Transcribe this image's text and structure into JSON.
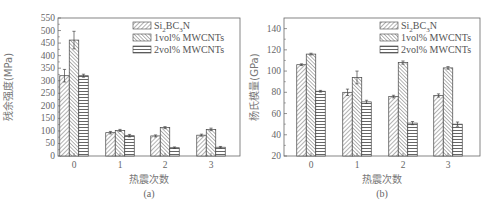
{
  "chart_data": [
    {
      "id": "a",
      "type": "bar",
      "title": "",
      "caption": "(a)",
      "xlabel": "热震次数",
      "ylabel": "残余强度(MPa)",
      "categories": [
        "0",
        "1",
        "2",
        "3"
      ],
      "ylim": [
        0,
        550
      ],
      "yticks": [
        0,
        50,
        100,
        150,
        200,
        250,
        300,
        350,
        400,
        450,
        500,
        550
      ],
      "grid": false,
      "legend_position": "upper right",
      "series": [
        {
          "name": "Si2BC3N",
          "pattern": "diagonal-forward",
          "values": [
            320,
            93,
            80,
            83
          ],
          "errors": [
            25,
            5,
            4,
            4
          ]
        },
        {
          "name": "1vol% MWCNTs",
          "pattern": "diagonal-backward",
          "values": [
            462,
            102,
            113,
            106
          ],
          "errors": [
            35,
            4,
            4,
            5
          ]
        },
        {
          "name": "2vol% MWCNTs",
          "pattern": "horizontal",
          "values": [
            320,
            81,
            33,
            35
          ],
          "errors": [
            6,
            5,
            3,
            3
          ]
        }
      ]
    },
    {
      "id": "b",
      "type": "bar",
      "title": "",
      "caption": "(b)",
      "xlabel": "热震次数",
      "ylabel": "杨氏模量(GPa)",
      "categories": [
        "0",
        "1",
        "2",
        "3"
      ],
      "ylim": [
        20,
        150
      ],
      "yticks": [
        20,
        40,
        60,
        80,
        100,
        120,
        140
      ],
      "grid": false,
      "legend_position": "upper right",
      "series": [
        {
          "name": "Si2BC3N",
          "pattern": "diagonal-forward",
          "values": [
            106,
            80,
            76,
            77
          ],
          "errors": [
            0.8,
            3,
            1.2,
            1.5
          ]
        },
        {
          "name": "1vol% MWCNTs",
          "pattern": "diagonal-backward",
          "values": [
            116,
            94,
            108,
            103
          ],
          "errors": [
            0.8,
            6,
            1.5,
            1.2
          ]
        },
        {
          "name": "2vol% MWCNTs",
          "pattern": "horizontal",
          "values": [
            81,
            71,
            51,
            50
          ],
          "errors": [
            0.8,
            1.5,
            1.5,
            2
          ]
        }
      ]
    }
  ],
  "legend": {
    "items": [
      {
        "main": "Si",
        "sub1": "2",
        "mid": "BC",
        "sub2": "3",
        "end": "N"
      },
      {
        "text": "1vol% MWCNTs"
      },
      {
        "text": "2vol% MWCNTs"
      }
    ]
  },
  "labels": {
    "a": {
      "ylabel": "残余强度(MPa)",
      "xlabel": "热震次数",
      "caption": "(a)"
    },
    "b": {
      "ylabel": "杨氏模量(GPa)",
      "xlabel": "热震次数",
      "caption": "(b)"
    }
  }
}
